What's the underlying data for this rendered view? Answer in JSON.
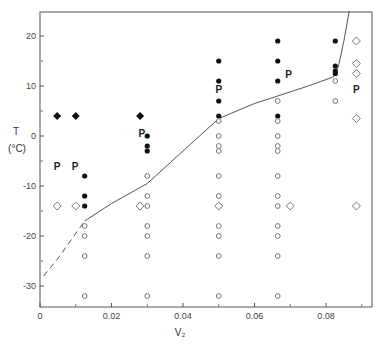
{
  "chart_data": {
    "type": "scatter",
    "title": "",
    "xlabel": "V₂",
    "ylabel": "T (°C)",
    "xlim": [
      0,
      0.093
    ],
    "ylim": [
      -34,
      25
    ],
    "grid": false,
    "x_ticks": [
      0,
      0.02,
      0.04,
      0.06,
      0.08
    ],
    "x_tick_labels": [
      "0",
      "0.02",
      "0.04",
      "0.06",
      "0.08"
    ],
    "x_minor_ticks": [
      0.01,
      0.03,
      0.05,
      0.07,
      0.09
    ],
    "y_ticks": [
      20,
      10,
      0,
      -10,
      -20,
      -30
    ],
    "y_tick_labels": [
      "20",
      "10",
      "0",
      "-10",
      "-20",
      "-30"
    ],
    "y_minor_ticks": [
      15,
      5,
      -5,
      -15,
      -25
    ],
    "series": [
      {
        "name": "filled circles",
        "marker": "filled-circle",
        "points": [
          [
            0.0125,
            -8
          ],
          [
            0.0125,
            -12
          ],
          [
            0.0125,
            -14
          ],
          [
            0.03,
            0
          ],
          [
            0.03,
            -2
          ],
          [
            0.03,
            -3
          ],
          [
            0.05,
            15
          ],
          [
            0.05,
            11
          ],
          [
            0.05,
            7
          ],
          [
            0.05,
            4
          ],
          [
            0.0665,
            19
          ],
          [
            0.0665,
            15
          ],
          [
            0.0665,
            11
          ],
          [
            0.0665,
            4
          ],
          [
            0.0826,
            19
          ],
          [
            0.0826,
            14
          ],
          [
            0.0826,
            13
          ],
          [
            0.0826,
            12.5
          ]
        ]
      },
      {
        "name": "open circles",
        "marker": "open-circle",
        "points": [
          [
            0.0125,
            -18
          ],
          [
            0.0125,
            -20
          ],
          [
            0.0125,
            -24
          ],
          [
            0.0125,
            -32
          ],
          [
            0.03,
            -8
          ],
          [
            0.03,
            -12
          ],
          [
            0.03,
            -14
          ],
          [
            0.03,
            -18
          ],
          [
            0.03,
            -20
          ],
          [
            0.03,
            -24
          ],
          [
            0.03,
            -32
          ],
          [
            0.05,
            3
          ],
          [
            0.05,
            0
          ],
          [
            0.05,
            -2
          ],
          [
            0.05,
            -3
          ],
          [
            0.05,
            -8
          ],
          [
            0.05,
            -12
          ],
          [
            0.05,
            -14
          ],
          [
            0.05,
            -18
          ],
          [
            0.05,
            -20
          ],
          [
            0.05,
            -24
          ],
          [
            0.05,
            -32
          ],
          [
            0.0665,
            7
          ],
          [
            0.0665,
            3
          ],
          [
            0.0665,
            0
          ],
          [
            0.0665,
            -2
          ],
          [
            0.0665,
            -3
          ],
          [
            0.0665,
            -8
          ],
          [
            0.0665,
            -12
          ],
          [
            0.0665,
            -14
          ],
          [
            0.0665,
            -18
          ],
          [
            0.0665,
            -20
          ],
          [
            0.0665,
            -24
          ],
          [
            0.0665,
            -32
          ],
          [
            0.0826,
            11
          ],
          [
            0.0826,
            7
          ]
        ]
      },
      {
        "name": "filled diamonds",
        "marker": "filled-diamond",
        "points": [
          [
            0.0048,
            4
          ],
          [
            0.01,
            4
          ],
          [
            0.028,
            4
          ]
        ]
      },
      {
        "name": "open diamonds",
        "marker": "open-diamond",
        "points": [
          [
            0.0048,
            -14
          ],
          [
            0.01,
            -14
          ],
          [
            0.028,
            -14
          ],
          [
            0.05,
            -14
          ],
          [
            0.07,
            -14
          ],
          [
            0.0885,
            19
          ],
          [
            0.0885,
            14.5
          ],
          [
            0.0885,
            12.5
          ],
          [
            0.0885,
            3.5
          ],
          [
            0.0885,
            -14
          ]
        ]
      }
    ],
    "annotations": [
      {
        "text": "P",
        "x": 0.0048,
        "y": -6
      },
      {
        "text": "P",
        "x": 0.0098,
        "y": -6
      },
      {
        "text": "P",
        "x": 0.0285,
        "y": 0.6
      },
      {
        "text": "P",
        "x": 0.05,
        "y": 9.5
      },
      {
        "text": "P",
        "x": 0.0695,
        "y": 12.5
      },
      {
        "text": "P",
        "x": 0.0885,
        "y": 9.5
      }
    ],
    "curve": {
      "name": "phase boundary",
      "dashed_points": [
        [
          0.001,
          -28
        ],
        [
          0.005,
          -24.5
        ],
        [
          0.009,
          -20.5
        ],
        [
          0.0125,
          -17
        ]
      ],
      "solid_points": [
        [
          0.0125,
          -17
        ],
        [
          0.02,
          -13.5
        ],
        [
          0.03,
          -9.5
        ],
        [
          0.04,
          -3
        ],
        [
          0.05,
          3.5
        ],
        [
          0.06,
          6.5
        ],
        [
          0.0665,
          8
        ],
        [
          0.075,
          10
        ],
        [
          0.082,
          11.8
        ],
        [
          0.0835,
          14
        ],
        [
          0.085,
          19
        ],
        [
          0.0865,
          25
        ]
      ]
    }
  }
}
